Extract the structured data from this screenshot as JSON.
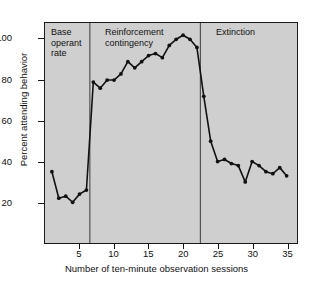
{
  "chart_data": {
    "type": "line",
    "title": "",
    "xlabel": "Number of ten-minute observation sessions",
    "ylabel": "Percent attending behavior",
    "xlim": [
      0,
      36.5
    ],
    "ylim": [
      0,
      108
    ],
    "grid": false,
    "legend": "none",
    "background": "#cfcfcf",
    "line_color": "#111111",
    "marker": "filled-circle",
    "x": [
      1,
      2,
      3,
      4,
      5,
      6,
      7,
      8,
      9,
      10,
      11,
      12,
      13,
      14,
      15,
      16,
      17,
      18,
      19,
      20,
      21,
      22,
      23,
      24,
      25,
      26,
      27,
      28,
      29,
      30,
      31,
      32,
      33,
      34,
      35
    ],
    "values": [
      35,
      22,
      23,
      20,
      24,
      26,
      79,
      76,
      80,
      80,
      83,
      89,
      86,
      89,
      92,
      93,
      91,
      97,
      100,
      102,
      100,
      96,
      72,
      50,
      40,
      41,
      39,
      38,
      30,
      40,
      38,
      35,
      34,
      37,
      33
    ],
    "xticks": [
      5,
      10,
      15,
      20,
      25,
      30,
      35
    ],
    "yticks": [
      20,
      40,
      60,
      80,
      100
    ],
    "annotations": [
      {
        "text": "Base\noperant\nrate",
        "phase": "baseline"
      },
      {
        "text": "Reinforcement\ncontingency",
        "phase": "treatment"
      },
      {
        "text": "Extinction",
        "phase": "extinction"
      }
    ],
    "phase_dividers": [
      6.5,
      22.5
    ]
  },
  "axes": {
    "y_label": "Percent attending behavior",
    "x_label": "Number of ten-minute observation sessions",
    "y_ticks": [
      "20",
      "40",
      "60",
      "80",
      "100"
    ],
    "x_ticks": [
      "5",
      "10",
      "15",
      "20",
      "25",
      "30",
      "35"
    ]
  },
  "phases": [
    {
      "label": "Base\noperant\nrate"
    },
    {
      "label": "Reinforcement\ncontingency"
    },
    {
      "label": "Extinction"
    }
  ],
  "colors": {
    "plot_background": "#cfcfcf",
    "page_background": "#ffffff",
    "line": "#111111",
    "axis": "#1a1a1a",
    "text": "#111111"
  }
}
